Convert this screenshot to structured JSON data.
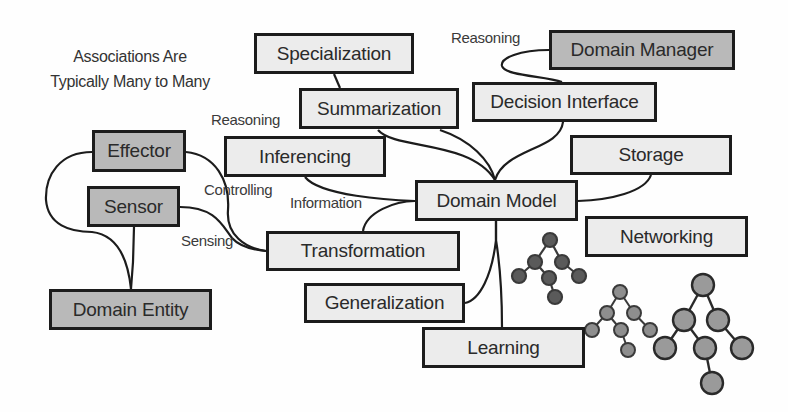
{
  "diagram": {
    "caption": {
      "line1": "Associations Are",
      "line2": "Typically Many to Many"
    },
    "nodes": {
      "specialization": {
        "label": "Specialization",
        "style": "light"
      },
      "summarization": {
        "label": "Summarization",
        "style": "light"
      },
      "inferencing": {
        "label": "Inferencing",
        "style": "light"
      },
      "transformation": {
        "label": "Transformation",
        "style": "light"
      },
      "generalization": {
        "label": "Generalization",
        "style": "light"
      },
      "learning": {
        "label": "Learning",
        "style": "light"
      },
      "domain_model": {
        "label": "Domain Model",
        "style": "light"
      },
      "decision_interface": {
        "label": "Decision Interface",
        "style": "light"
      },
      "storage": {
        "label": "Storage",
        "style": "light"
      },
      "networking": {
        "label": "Networking",
        "style": "light"
      },
      "domain_manager": {
        "label": "Domain Manager",
        "style": "dark"
      },
      "effector": {
        "label": "Effector",
        "style": "dark"
      },
      "sensor": {
        "label": "Sensor",
        "style": "dark"
      },
      "domain_entity": {
        "label": "Domain Entity",
        "style": "dark"
      }
    },
    "edge_labels": {
      "reasoning_top": "Reasoning",
      "reasoning_left": "Reasoning",
      "controlling": "Controlling",
      "information": "Information",
      "sensing": "Sensing"
    },
    "edges": [
      {
        "from": "Domain Manager",
        "to": "Decision Interface",
        "label": "Reasoning"
      },
      {
        "from": "Decision Interface",
        "to": "Domain Model"
      },
      {
        "from": "Summarization",
        "to": "Domain Model"
      },
      {
        "from": "Specialization",
        "to": "Summarization"
      },
      {
        "from": "Inferencing",
        "to": "Domain Model",
        "label": "Information"
      },
      {
        "from": "Transformation",
        "to": "Domain Model"
      },
      {
        "from": "Storage",
        "to": "Domain Model"
      },
      {
        "from": "Domain Model",
        "to": "Generalization"
      },
      {
        "from": "Domain Model",
        "to": "Learning"
      },
      {
        "from": "Effector",
        "to": "Transformation",
        "label": "Controlling"
      },
      {
        "from": "Sensor",
        "to": "Transformation",
        "label": "Sensing"
      },
      {
        "from": "Effector",
        "to": "Domain Entity"
      },
      {
        "from": "Sensor",
        "to": "Domain Entity"
      }
    ],
    "decorations": [
      "tree-graphic-dark",
      "tree-graphic-medium",
      "tree-graphic-large"
    ],
    "colors": {
      "light_box": "#ececec",
      "dark_box": "#b9b9b9",
      "stroke": "#1c1c1c",
      "tree_dark": "#5a5a5a",
      "tree_medium": "#8e8e8e",
      "tree_large": "#9a9a9a"
    }
  }
}
